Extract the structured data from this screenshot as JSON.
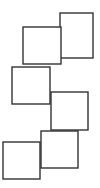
{
  "figure": {
    "width": 100,
    "height": 188,
    "background_color": "#ffffff",
    "stroke_color": "#333333",
    "fill_color": "#ffffff",
    "stroke_width": 1.4
  },
  "chart_data": {
    "type": "diagram",
    "xlabel": "",
    "ylabel": "",
    "grid": false,
    "legend": false,
    "xlim": [
      0,
      100
    ],
    "ylim": [
      0,
      188
    ],
    "shapes": [
      {
        "name": "square-1",
        "label": "1",
        "x": 60,
        "y": 13,
        "width": 33,
        "height": 45,
        "z": 1
      },
      {
        "name": "square-2",
        "label": "2",
        "x": 23,
        "y": 27,
        "width": 38,
        "height": 37,
        "z": 2
      },
      {
        "name": "square-3",
        "label": "3",
        "x": 12,
        "y": 67,
        "width": 38,
        "height": 37,
        "z": 3
      },
      {
        "name": "square-4",
        "label": "4",
        "x": 51,
        "y": 92,
        "width": 37,
        "height": 38,
        "z": 4
      },
      {
        "name": "square-5",
        "label": "5",
        "x": 41,
        "y": 131,
        "width": 37,
        "height": 37,
        "z": 5
      },
      {
        "name": "square-6",
        "label": "6",
        "x": 3,
        "y": 142,
        "width": 37,
        "height": 37,
        "z": 6
      }
    ]
  }
}
